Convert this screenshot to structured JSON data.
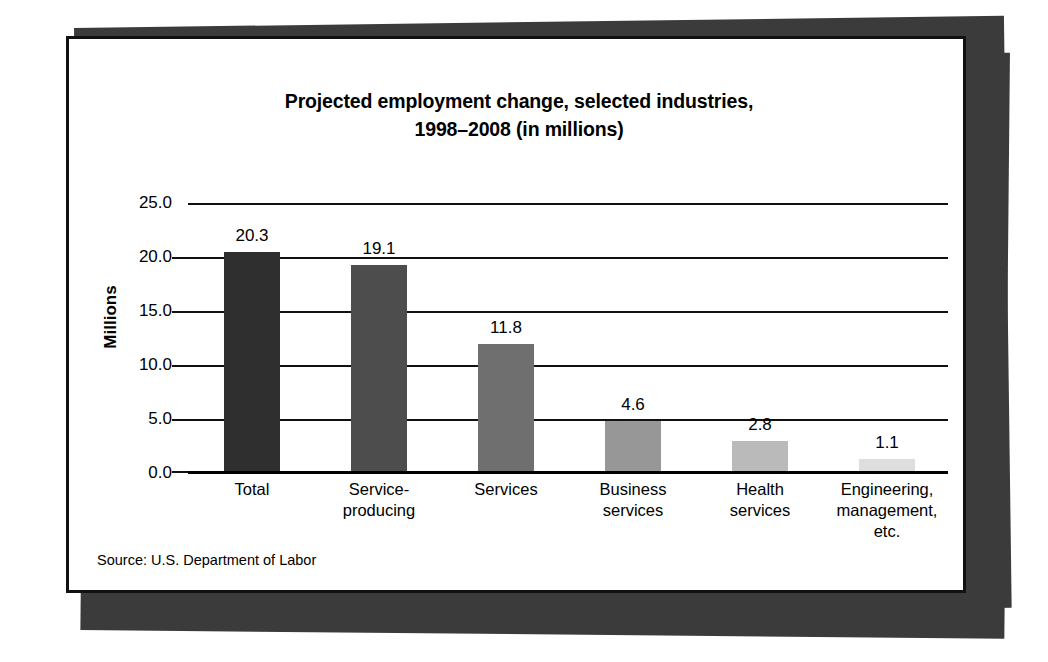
{
  "figure": {
    "source_note": "Source: U.S. Department of Labor",
    "frame_color": "#111111",
    "shadow_color": "#3b3b3b",
    "card_background": "#ffffff"
  },
  "chart_data": {
    "type": "bar",
    "title": "Projected employment change, selected industries, 1998–2008 (in millions)",
    "title_lines": [
      "Projected employment change, selected industries,",
      "1998–2008 (in millions)"
    ],
    "xlabel": "",
    "ylabel": "Millions",
    "ylim": [
      0.0,
      25.0
    ],
    "ytick_step": 5.0,
    "ytick_labels": [
      "25.0",
      "20.0",
      "15.0",
      "10.0",
      "5.0",
      "0.0"
    ],
    "ytick_values": [
      25.0,
      20.0,
      15.0,
      10.0,
      5.0,
      0.0
    ],
    "grid": true,
    "legend": false,
    "legend_position": "none",
    "categories": [
      "Total",
      "Service-producing",
      "Services",
      "Business services",
      "Health services",
      "Engineering, management, etc."
    ],
    "category_lines": [
      [
        "Total"
      ],
      [
        "Service-",
        "producing"
      ],
      [
        "Services"
      ],
      [
        "Business",
        "services"
      ],
      [
        "Health",
        "services"
      ],
      [
        "Engineering,",
        "management,",
        "etc."
      ]
    ],
    "values": [
      20.3,
      19.1,
      11.8,
      4.6,
      2.8,
      1.1
    ],
    "value_labels": [
      "20.3",
      "19.1",
      "11.8",
      "4.6",
      "2.8",
      "1.1"
    ],
    "bar_colors": [
      "#2f2f2f",
      "#4d4d4d",
      "#6f6f6f",
      "#979797",
      "#bababa",
      "#dedede"
    ]
  }
}
